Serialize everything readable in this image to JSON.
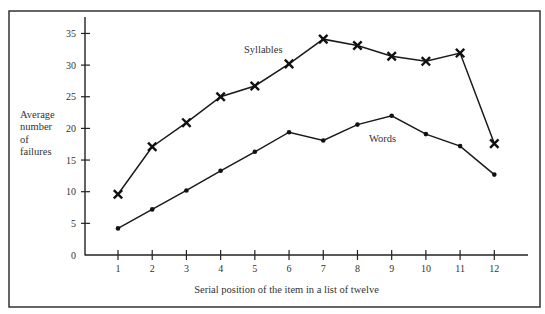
{
  "chart_data": {
    "type": "line",
    "title": "",
    "xlabel": "Serial position of the item in a list of twelve",
    "ylabel": "Average number of failures",
    "ylabel_lines": [
      "Average",
      "number",
      "of",
      "failures"
    ],
    "x": [
      1,
      2,
      3,
      4,
      5,
      6,
      7,
      8,
      9,
      10,
      11,
      12
    ],
    "x_tick_labels": [
      "1",
      "2",
      "3",
      "4",
      "5",
      "6",
      "7",
      "8",
      "9",
      "10",
      "11",
      "12"
    ],
    "y_ticks": [
      0,
      5,
      10,
      15,
      20,
      25,
      30,
      35
    ],
    "y_tick_labels": [
      "0",
      "5",
      "10",
      "15",
      "20",
      "25",
      "30",
      "35"
    ],
    "ylim": [
      0,
      37
    ],
    "xlim": [
      0,
      13
    ],
    "grid": false,
    "legend": "none (inline annotations)",
    "series": [
      {
        "name": "Syllables",
        "marker": "x",
        "values": [
          9.6,
          17.1,
          20.9,
          25.0,
          26.7,
          30.2,
          34.1,
          33.1,
          31.4,
          30.6,
          31.9,
          17.6
        ],
        "annotation": {
          "text": "Syllables",
          "near_x": 5.8,
          "near_y": 32.5
        }
      },
      {
        "name": "Words",
        "marker": "dot",
        "values": [
          4.2,
          7.2,
          10.2,
          13.3,
          16.3,
          19.4,
          18.1,
          20.6,
          22.0,
          19.1,
          17.2,
          12.7
        ],
        "annotation": {
          "text": "Words",
          "near_x": 8.5,
          "near_y": 18.8
        }
      }
    ]
  }
}
